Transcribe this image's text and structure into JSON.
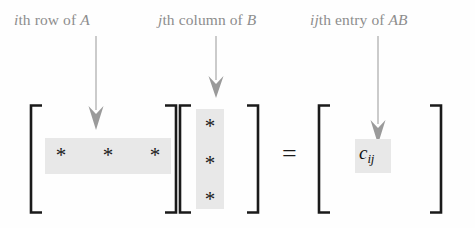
{
  "figure": {
    "type": "matrix-multiplication-diagram",
    "background_color": "#fefefe",
    "ink_color": "#1a1a1a",
    "label_color": "#8d8d8d",
    "highlight_color": "#e8e8e8",
    "arrow_color": "#9a9a9a"
  },
  "labels": {
    "row": {
      "prefix_italic": "i",
      "middle": "th row of ",
      "suffix_italic": "A",
      "full_text": "ith row of A"
    },
    "column": {
      "prefix_italic": "j",
      "middle": "th column of ",
      "suffix_italic": "B",
      "full_text": "jth column of B"
    },
    "entry": {
      "prefix_italic": "ij",
      "middle": "th entry of ",
      "suffix_italic": "AB",
      "full_text": "ijth entry of AB"
    }
  },
  "matrices": {
    "a": {
      "name": "A",
      "highlight": "row",
      "entries": [
        "*",
        "*",
        "*"
      ]
    },
    "b": {
      "name": "B",
      "highlight": "column",
      "entries": [
        "*",
        "*",
        "*"
      ]
    },
    "product": {
      "name": "AB",
      "highlight": "entry",
      "entry_base": "c",
      "entry_subscript": "ij"
    }
  },
  "operator": {
    "equals": "="
  }
}
